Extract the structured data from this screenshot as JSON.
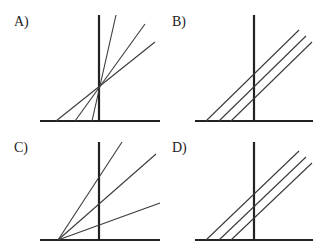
{
  "panels": [
    {
      "label": "A)",
      "description": "Three lines with different slopes intersecting at a common point on the vertical axis",
      "label_pos": [
        14,
        14
      ],
      "axis_h": {
        "x1": 40,
        "x2": 160,
        "y": 121
      },
      "axis_v": {
        "x": 99,
        "y1": 15,
        "y2": 121
      },
      "lines": [
        {
          "x1": 92,
          "y1": 121,
          "x2": 116,
          "y2": 15
        },
        {
          "x1": 75,
          "y1": 121,
          "x2": 145,
          "y2": 24
        },
        {
          "x1": 56,
          "y1": 121,
          "x2": 155,
          "y2": 42
        }
      ]
    },
    {
      "label": "B)",
      "description": "Three parallel lines with equal slopes and different intercepts",
      "label_pos": [
        172,
        14
      ],
      "axis_h": {
        "x1": 195,
        "x2": 313,
        "y": 121
      },
      "axis_v": {
        "x": 254,
        "y1": 15,
        "y2": 121
      },
      "lines": [
        {
          "x1": 206,
          "y1": 121,
          "x2": 299,
          "y2": 30
        },
        {
          "x1": 219,
          "y1": 121,
          "x2": 306,
          "y2": 36
        },
        {
          "x1": 231,
          "y1": 121,
          "x2": 312,
          "y2": 42
        }
      ]
    },
    {
      "label": "C)",
      "description": "Three lines fanning out from a common origin on the horizontal axis",
      "label_pos": [
        14,
        140
      ],
      "axis_h": {
        "x1": 40,
        "x2": 160,
        "y": 240
      },
      "axis_v": {
        "x": 99,
        "y1": 142,
        "y2": 240
      },
      "lines": [
        {
          "x1": 58,
          "y1": 240,
          "x2": 122,
          "y2": 142
        },
        {
          "x1": 58,
          "y1": 240,
          "x2": 156,
          "y2": 154
        },
        {
          "x1": 58,
          "y1": 240,
          "x2": 160,
          "y2": 203
        }
      ]
    },
    {
      "label": "D)",
      "description": "Three parallel lines with equal slopes and different intercepts",
      "label_pos": [
        172,
        140
      ],
      "axis_h": {
        "x1": 195,
        "x2": 313,
        "y": 240
      },
      "axis_v": {
        "x": 254,
        "y1": 142,
        "y2": 240
      },
      "lines": [
        {
          "x1": 206,
          "y1": 240,
          "x2": 299,
          "y2": 151
        },
        {
          "x1": 219,
          "y1": 240,
          "x2": 306,
          "y2": 157
        },
        {
          "x1": 231,
          "y1": 240,
          "x2": 312,
          "y2": 163
        }
      ]
    }
  ],
  "colors": {
    "axis": "#222222",
    "line": "#3a3a3a",
    "background": "#ffffff"
  }
}
